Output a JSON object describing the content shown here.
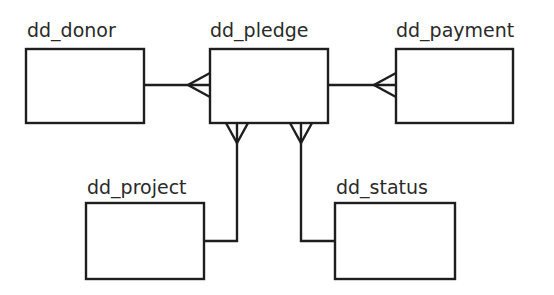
{
  "diagram": {
    "type": "entity-relationship",
    "notation": "crow's foot",
    "colors": {
      "line": "#1e1e1e",
      "text": "#2a2a2a",
      "background": "#ffffff"
    },
    "entities": [
      {
        "id": "donor",
        "label": "dd_donor"
      },
      {
        "id": "pledge",
        "label": "dd_pledge"
      },
      {
        "id": "payment",
        "label": "dd_payment"
      },
      {
        "id": "project",
        "label": "dd_project"
      },
      {
        "id": "status",
        "label": "dd_status"
      }
    ],
    "relationships": [
      {
        "from": "dd_donor",
        "to": "dd_pledge",
        "cardinality": "one-to-many",
        "many_side": "dd_pledge"
      },
      {
        "from": "dd_pledge",
        "to": "dd_payment",
        "cardinality": "one-to-many",
        "many_side": "dd_payment"
      },
      {
        "from": "dd_project",
        "to": "dd_pledge",
        "cardinality": "one-to-many",
        "many_side": "dd_pledge"
      },
      {
        "from": "dd_status",
        "to": "dd_pledge",
        "cardinality": "one-to-many",
        "many_side": "dd_pledge"
      }
    ]
  }
}
